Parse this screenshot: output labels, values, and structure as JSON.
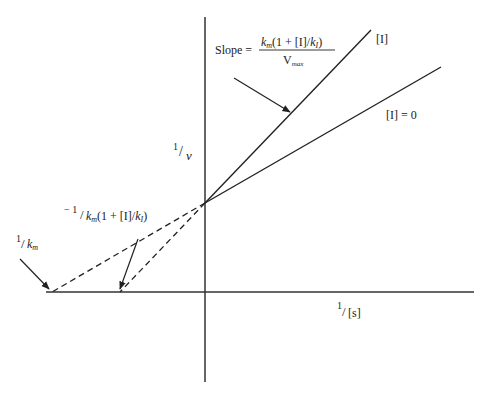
{
  "figure": {
    "type": "Lineweaver-Burk plot (competitive inhibition)",
    "y_axis_label_num": "1",
    "y_axis_label_den": "v",
    "x_axis_label_num": "1",
    "x_axis_label_den": "[s]",
    "line_inhibited_label": "[I]",
    "line_uninhibited_label": "[I] = 0",
    "slope_label": {
      "prefix": "Slope =",
      "numerator": "k_m(1 + [I]/k_I)",
      "numerator_k": "k",
      "numerator_k_sub": "m",
      "numerator_mid": "(1 + [I]/",
      "numerator_k2": "k",
      "numerator_k2_sub": "I",
      "numerator_end": ")",
      "denominator": "V",
      "denominator_sub": "max"
    },
    "intercept_uninhibited": {
      "text": "1/k_m",
      "num": "1",
      "den_k": "k",
      "den_sub": "m"
    },
    "intercept_inhibited": {
      "text": "−1/k_m(1 + [I]/k_I)",
      "prefix": "− 1",
      "den_k": "k",
      "den_sub": "m",
      "mid": "(1 + [I]/",
      "k2": "k",
      "k2_sub": "I",
      "end": ")"
    },
    "colors": {
      "ink": "#222222",
      "background": "#ffffff"
    }
  }
}
